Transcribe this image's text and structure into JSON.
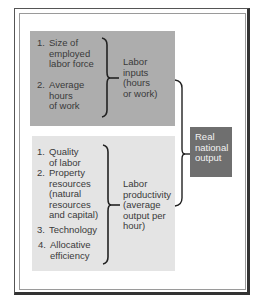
{
  "diagram": {
    "upper_group": {
      "items": [
        {
          "number": "1.",
          "label": "Size of\nemployed\nlabor force"
        },
        {
          "number": "2.",
          "label": "Average\nhours\nof work"
        }
      ],
      "result_label": "Labor\ninputs\n(hours\nor work)",
      "color": "#adadad"
    },
    "lower_group": {
      "items": [
        {
          "number": "1.",
          "label": "Quality\nof labor"
        },
        {
          "number": "2.",
          "label": "Property\nresources\n(natural\nresources\nand capital)"
        },
        {
          "number": "3.",
          "label": "Technology"
        },
        {
          "number": "4.",
          "label": "Allocative\nefficiency"
        }
      ],
      "result_label": "Labor\nproductivity\n(average\noutput per\nhour)",
      "color": "#e4e4e4"
    },
    "output_box": {
      "label": "Real\nnational\noutput",
      "color": "#6f6f6f"
    }
  }
}
